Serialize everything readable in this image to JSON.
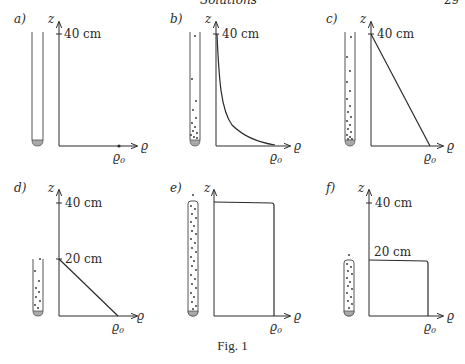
{
  "header": {
    "title": "Solutions",
    "page_number": "29"
  },
  "figure": {
    "caption": "Fig. 1",
    "axis_labels": {
      "vertical": "z",
      "horizontal": "ϱ",
      "rho0": "ϱ0"
    },
    "panels": [
      {
        "id": "a",
        "label": "a)",
        "tick_top": "40 cm",
        "curve": "none (zero density, particles absent)",
        "tube": "full height, empty, sediment at bottom"
      },
      {
        "id": "b",
        "label": "b)",
        "tick_top": "40 cm",
        "curve": "hyperbolic decay: high density at bottom, decaying toward 40 cm",
        "tube": "full height, particles concentrated near bottom"
      },
      {
        "id": "c",
        "label": "c)",
        "tick_top": "40 cm",
        "curve": "linear decrease from ϱ0 at bottom to 0 at 40 cm",
        "tube": "full height, particle density increasing downward"
      },
      {
        "id": "d",
        "label": "d)",
        "tick_top": "40 cm",
        "tick_mid": "20 cm",
        "curve": "linear decrease from ϱ0 at bottom to 0 at 20 cm",
        "tube": "half height (20 cm)"
      },
      {
        "id": "e",
        "label": "e)",
        "curve": "uniform density ϱ0 over full height",
        "tube": "full height, uniformly filled"
      },
      {
        "id": "f",
        "label": "f)",
        "tick_top": "40 cm",
        "tick_mid": "20 cm",
        "curve": "uniform density ϱ0 up to 20 cm",
        "tube": "half height, uniformly filled"
      }
    ]
  },
  "colors": {
    "ink": "#2a2a2a",
    "sediment": "#a9a9a9",
    "paper": "#ffffff"
  }
}
